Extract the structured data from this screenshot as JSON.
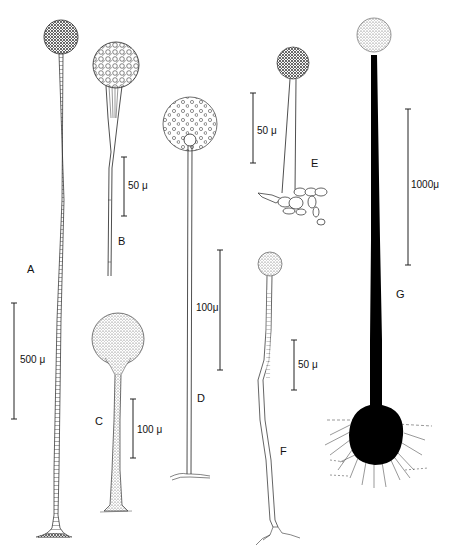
{
  "figure": {
    "panels": [
      {
        "id": "A",
        "label": "A",
        "scale_bar": "500 μ"
      },
      {
        "id": "B",
        "label": "B",
        "scale_bar": "50 μ"
      },
      {
        "id": "C",
        "label": "C",
        "scale_bar": "100 μ"
      },
      {
        "id": "D",
        "label": "D",
        "scale_bar": "100μ"
      },
      {
        "id": "E",
        "label": "E",
        "scale_bar": "50 μ"
      },
      {
        "id": "F",
        "label": "F",
        "scale_bar": "50 μ"
      },
      {
        "id": "G",
        "label": "G",
        "scale_bar": "1000μ"
      }
    ],
    "colors": {
      "ink": "#111111",
      "background": "#ffffff"
    }
  }
}
